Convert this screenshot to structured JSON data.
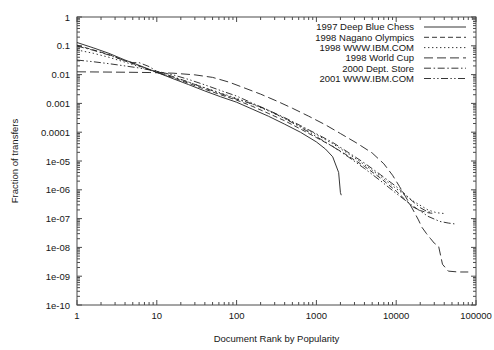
{
  "chart_data": {
    "type": "line",
    "title": "",
    "xlabel": "Document Rank by Popularity",
    "ylabel": "Fraction of transfers",
    "xscale": "log",
    "yscale": "log",
    "xlim": [
      1,
      100000
    ],
    "ylim": [
      1e-10,
      1
    ],
    "grid": false,
    "legend_position": "top-right",
    "xticks": [
      "1",
      "10",
      "100",
      "1000",
      "10000",
      "100000"
    ],
    "xtick_values": [
      1,
      10,
      100,
      1000,
      10000,
      100000
    ],
    "yticks": [
      "1",
      "0.1",
      "0.01",
      "0.001",
      "0.0001",
      "1e-05",
      "1e-06",
      "1e-07",
      "1e-08",
      "1e-09",
      "1e-10"
    ],
    "ytick_values": [
      1,
      0.1,
      0.01,
      0.001,
      0.0001,
      1e-05,
      1e-06,
      1e-07,
      1e-08,
      1e-09,
      1e-10
    ],
    "series": [
      {
        "name": "1997 Deep Blue Chess",
        "dash": "solid",
        "points": [
          [
            1,
            0.13
          ],
          [
            1.6,
            0.085
          ],
          [
            2.5,
            0.055
          ],
          [
            4,
            0.032
          ],
          [
            6,
            0.021
          ],
          [
            10,
            0.012
          ],
          [
            16,
            0.0072
          ],
          [
            25,
            0.0045
          ],
          [
            40,
            0.0027
          ],
          [
            63,
            0.0017
          ],
          [
            100,
            0.0011
          ],
          [
            160,
            0.00062
          ],
          [
            250,
            0.00036
          ],
          [
            400,
            0.00019
          ],
          [
            630,
            0.0001
          ],
          [
            1000,
            4.6e-05
          ],
          [
            1300,
            2.6e-05
          ],
          [
            1600,
            1.4e-05
          ],
          [
            1900,
            4e-06
          ],
          [
            2000,
            8e-07
          ],
          [
            2050,
            6.5e-07
          ]
        ]
      },
      {
        "name": "1998 Nagano Olympics",
        "dash": "dashed",
        "points": [
          [
            1,
            0.105
          ],
          [
            1.6,
            0.072
          ],
          [
            2.5,
            0.05
          ],
          [
            4,
            0.03
          ],
          [
            6,
            0.02
          ],
          [
            10,
            0.012
          ],
          [
            16,
            0.0078
          ],
          [
            25,
            0.005
          ],
          [
            40,
            0.0031
          ],
          [
            63,
            0.002
          ],
          [
            100,
            0.0013
          ],
          [
            160,
            0.00078
          ],
          [
            250,
            0.00045
          ],
          [
            400,
            0.00025
          ],
          [
            630,
            0.00013
          ],
          [
            1000,
            6.5e-05
          ],
          [
            1600,
            3.2e-05
          ],
          [
            2500,
            1.5e-05
          ],
          [
            4000,
            6.5e-06
          ],
          [
            6300,
            2.6e-06
          ],
          [
            10000,
            9e-07
          ],
          [
            13000,
            4.5e-07
          ],
          [
            16000,
            2.6e-07
          ],
          [
            20000,
            1.9e-07
          ],
          [
            25000,
            1.6e-07
          ],
          [
            30000,
            1.5e-07
          ]
        ]
      },
      {
        "name": "1998 WWW.IBM.COM",
        "dash": "dotted",
        "points": [
          [
            1,
            0.072
          ],
          [
            1.6,
            0.055
          ],
          [
            2.5,
            0.04
          ],
          [
            4,
            0.027
          ],
          [
            6,
            0.019
          ],
          [
            10,
            0.012
          ],
          [
            16,
            0.0082
          ],
          [
            25,
            0.0055
          ],
          [
            40,
            0.0035
          ],
          [
            63,
            0.0023
          ],
          [
            100,
            0.0015
          ],
          [
            160,
            0.00092
          ],
          [
            250,
            0.00055
          ],
          [
            400,
            0.0003
          ],
          [
            630,
            0.00016
          ],
          [
            1000,
            8.2e-05
          ],
          [
            1600,
            4e-05
          ],
          [
            2500,
            1.8e-05
          ],
          [
            4000,
            7.5e-06
          ],
          [
            6300,
            3e-06
          ],
          [
            10000,
            1.1e-06
          ],
          [
            16000,
            4.2e-07
          ],
          [
            25000,
            2e-07
          ],
          [
            32000,
            1.6e-07
          ],
          [
            40000,
            1.5e-07
          ]
        ]
      },
      {
        "name": "1998 World Cup",
        "dash": "longdash",
        "points": [
          [
            1,
            0.0125
          ],
          [
            2,
            0.0123
          ],
          [
            4,
            0.0121
          ],
          [
            8,
            0.0118
          ],
          [
            16,
            0.0112
          ],
          [
            30,
            0.0098
          ],
          [
            50,
            0.008
          ],
          [
            80,
            0.0055
          ],
          [
            120,
            0.0036
          ],
          [
            200,
            0.0021
          ],
          [
            320,
            0.0012
          ],
          [
            500,
            0.00068
          ],
          [
            800,
            0.00036
          ],
          [
            1300,
            0.00018
          ],
          [
            2000,
            9e-05
          ],
          [
            3200,
            4.2e-05
          ],
          [
            5000,
            1.9e-05
          ],
          [
            7000,
            8e-06
          ],
          [
            9000,
            3.2e-06
          ],
          [
            11000,
            1.3e-06
          ],
          [
            13000,
            6e-07
          ],
          [
            15000,
            3e-07
          ],
          [
            17000,
            1.6e-07
          ],
          [
            19000,
            9e-08
          ],
          [
            21000,
            5e-08
          ],
          [
            24000,
            3e-08
          ],
          [
            27000,
            2e-08
          ],
          [
            30000,
            1.4e-08
          ],
          [
            34000,
            1.1e-08
          ],
          [
            38000,
            2.6e-09
          ],
          [
            45000,
            1.5e-09
          ],
          [
            60000,
            1.4e-09
          ],
          [
            80000,
            1.4e-09
          ]
        ]
      },
      {
        "name": "2000 Dept. Store",
        "dash": "dashdot",
        "points": [
          [
            1,
            0.098
          ],
          [
            1.6,
            0.07
          ],
          [
            2.5,
            0.048
          ],
          [
            4,
            0.03
          ],
          [
            5,
            0.026
          ],
          [
            6,
            0.026
          ],
          [
            8,
            0.019
          ],
          [
            10,
            0.013
          ],
          [
            16,
            0.0085
          ],
          [
            25,
            0.0055
          ],
          [
            40,
            0.0034
          ],
          [
            63,
            0.0022
          ],
          [
            100,
            0.0014
          ],
          [
            160,
            0.00095
          ],
          [
            250,
            0.00058
          ],
          [
            400,
            0.00032
          ],
          [
            630,
            0.00017
          ],
          [
            1000,
            8.8e-05
          ],
          [
            1600,
            4.4e-05
          ],
          [
            2500,
            2e-05
          ],
          [
            4000,
            8.5e-06
          ],
          [
            6300,
            3.4e-06
          ],
          [
            10000,
            1.3e-06
          ],
          [
            13000,
            7e-07
          ],
          [
            16000,
            4e-07
          ],
          [
            20000,
            2.4e-07
          ],
          [
            24000,
            1.8e-07
          ],
          [
            28000,
            1.6e-07
          ]
        ]
      },
      {
        "name": "2001 WWW.IBM.COM",
        "dash": "dashdotdot",
        "points": [
          [
            1,
            0.032
          ],
          [
            1.6,
            0.028
          ],
          [
            2.5,
            0.024
          ],
          [
            4,
            0.02
          ],
          [
            6,
            0.017
          ],
          [
            10,
            0.013
          ],
          [
            16,
            0.0098
          ],
          [
            25,
            0.0068
          ],
          [
            40,
            0.0044
          ],
          [
            63,
            0.0028
          ],
          [
            100,
            0.0018
          ],
          [
            160,
            0.001
          ],
          [
            250,
            0.00058
          ],
          [
            400,
            0.0003
          ],
          [
            630,
            0.00015
          ],
          [
            1000,
            7e-05
          ],
          [
            1600,
            3.2e-05
          ],
          [
            2500,
            1.4e-05
          ],
          [
            4000,
            5.5e-06
          ],
          [
            6300,
            2.1e-06
          ],
          [
            10000,
            7.5e-07
          ],
          [
            16000,
            2.8e-07
          ],
          [
            25000,
            1.2e-07
          ],
          [
            35000,
            8e-08
          ],
          [
            45000,
            7e-08
          ],
          [
            55000,
            6.5e-08
          ]
        ]
      }
    ]
  }
}
